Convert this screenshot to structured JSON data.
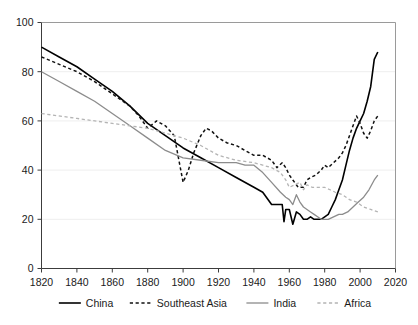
{
  "chart_data": {
    "type": "line",
    "title": "",
    "subtitle": "",
    "xlabel": "",
    "ylabel": "",
    "xlim": [
      1820,
      2020
    ],
    "ylim": [
      0,
      100
    ],
    "xticks": [
      1820,
      1840,
      1860,
      1880,
      1900,
      1920,
      1940,
      1960,
      1980,
      2000,
      2020
    ],
    "yticks": [
      0,
      20,
      40,
      60,
      80,
      100
    ],
    "grid": true,
    "legend_position": "bottom",
    "series": [
      {
        "name": "China",
        "color": "#000000",
        "style": "solid",
        "width": 1.6,
        "x": [
          1820,
          1830,
          1840,
          1850,
          1860,
          1870,
          1880,
          1890,
          1900,
          1910,
          1920,
          1930,
          1940,
          1945,
          1950,
          1952,
          1954,
          1956,
          1957,
          1958,
          1960,
          1962,
          1964,
          1966,
          1968,
          1970,
          1972,
          1974,
          1976,
          1978,
          1980,
          1982,
          1984,
          1986,
          1988,
          1990,
          1992,
          1994,
          1996,
          1998,
          2000,
          2002,
          2004,
          2006,
          2008,
          2010
        ],
        "y": [
          90,
          86,
          82,
          77,
          72,
          66,
          59,
          54,
          49,
          45,
          41,
          37,
          33,
          31,
          26,
          26,
          26,
          26,
          19,
          24,
          24,
          18,
          23,
          22,
          20,
          20,
          21,
          20,
          20,
          20,
          21,
          22,
          25,
          28,
          32,
          36,
          42,
          48,
          53,
          57,
          60,
          63,
          68,
          74,
          85,
          88
        ]
      },
      {
        "name": "Southeast Asia",
        "color": "#111111",
        "style": "dashed",
        "width": 1.5,
        "x": [
          1820,
          1830,
          1840,
          1850,
          1860,
          1870,
          1875,
          1880,
          1885,
          1890,
          1895,
          1900,
          1903,
          1906,
          1910,
          1913,
          1916,
          1920,
          1925,
          1930,
          1935,
          1940,
          1945,
          1950,
          1953,
          1956,
          1958,
          1960,
          1962,
          1965,
          1968,
          1970,
          1972,
          1975,
          1978,
          1980,
          1982,
          1985,
          1988,
          1990,
          1992,
          1994,
          1996,
          1998,
          2000,
          2002,
          2004,
          2006,
          2008,
          2010
        ],
        "y": [
          86,
          83,
          80,
          76,
          71,
          66,
          62,
          57,
          60,
          58,
          54,
          35,
          40,
          47,
          54,
          57,
          56,
          53,
          51,
          50,
          48,
          46,
          46,
          44,
          41,
          43,
          41,
          38,
          36,
          33,
          33,
          36,
          37,
          38,
          40,
          42,
          41,
          43,
          45,
          47,
          50,
          54,
          58,
          62,
          59,
          55,
          53,
          56,
          60,
          62
        ]
      },
      {
        "name": "India",
        "color": "#8c8c8c",
        "style": "solid",
        "width": 1.3,
        "x": [
          1820,
          1830,
          1840,
          1850,
          1860,
          1870,
          1880,
          1890,
          1900,
          1910,
          1920,
          1925,
          1930,
          1935,
          1940,
          1945,
          1950,
          1955,
          1958,
          1960,
          1962,
          1964,
          1966,
          1968,
          1970,
          1972,
          1974,
          1976,
          1978,
          1980,
          1982,
          1985,
          1988,
          1990,
          1993,
          1996,
          1999,
          2002,
          2005,
          2008,
          2010
        ],
        "y": [
          80,
          76,
          72,
          68,
          63,
          58,
          53,
          48,
          45,
          44,
          43,
          43,
          43,
          42,
          42,
          39,
          35,
          31,
          29,
          28,
          26,
          30,
          27,
          25,
          24,
          23,
          22,
          21,
          20,
          20,
          20,
          21,
          22,
          22,
          23,
          25,
          27,
          29,
          32,
          36,
          38
        ]
      },
      {
        "name": "Africa",
        "color": "#b4b4b4",
        "style": "dashed",
        "width": 1.3,
        "x": [
          1820,
          1840,
          1860,
          1880,
          1900,
          1910,
          1920,
          1930,
          1940,
          1945,
          1950,
          1955,
          1958,
          1960,
          1963,
          1966,
          1968,
          1970,
          1973,
          1976,
          1978,
          1980,
          1983,
          1986,
          1990,
          1994,
          1998,
          2002,
          2006,
          2010
        ],
        "y": [
          63,
          61,
          59,
          57,
          53,
          50,
          46,
          44,
          43,
          42,
          41,
          39,
          36,
          33,
          34,
          35,
          32,
          34,
          33,
          33,
          33,
          33,
          32,
          31,
          30,
          28,
          27,
          25,
          24,
          23
        ]
      }
    ],
    "legend": [
      {
        "label": "China",
        "color": "#000000",
        "style": "solid"
      },
      {
        "label": "Southeast Asia",
        "color": "#111111",
        "style": "dashed"
      },
      {
        "label": "India",
        "color": "#8c8c8c",
        "style": "solid"
      },
      {
        "label": "Africa",
        "color": "#b4b4b4",
        "style": "dashed"
      }
    ]
  },
  "axes": {
    "x_tick_labels": [
      "1820",
      "1840",
      "1860",
      "1880",
      "1900",
      "1920",
      "1940",
      "1960",
      "1980",
      "2000",
      "2020"
    ],
    "y_tick_labels": [
      "0",
      "20",
      "40",
      "60",
      "80",
      "100"
    ]
  }
}
